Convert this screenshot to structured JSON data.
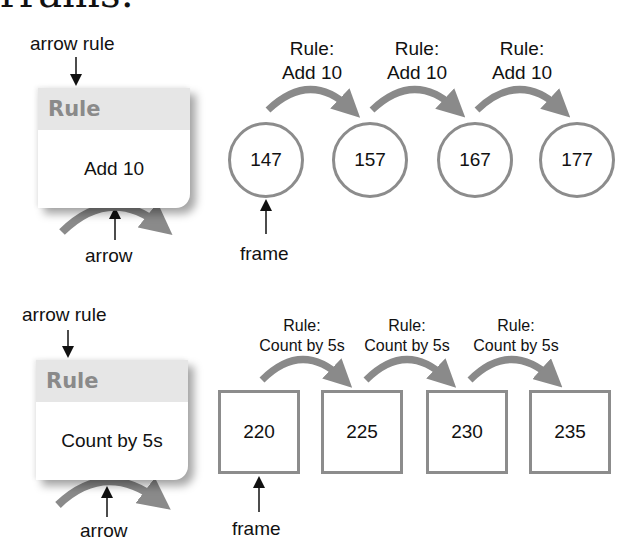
{
  "heading_fragment": "rrams:",
  "diagram_1": {
    "legend": {
      "arrow_rule_label": "arrow rule",
      "card_header": "Rule",
      "card_body": "Add 10",
      "arrow_label": "arrow"
    },
    "frame_label": "frame",
    "frame_shape": "circle",
    "steps": [
      {
        "rule_prefix": "Rule:",
        "rule_text": "Add 10"
      },
      {
        "rule_prefix": "Rule:",
        "rule_text": "Add 10"
      },
      {
        "rule_prefix": "Rule:",
        "rule_text": "Add 10"
      }
    ],
    "frames": [
      "147",
      "157",
      "167",
      "177"
    ]
  },
  "diagram_2": {
    "legend": {
      "arrow_rule_label": "arrow rule",
      "card_header": "Rule",
      "card_body": "Count by 5s",
      "arrow_label": "arrow"
    },
    "frame_label": "frame",
    "frame_shape": "square",
    "steps": [
      {
        "rule_prefix": "Rule:",
        "rule_text": "Count by 5s"
      },
      {
        "rule_prefix": "Rule:",
        "rule_text": "Count by 5s"
      },
      {
        "rule_prefix": "Rule:",
        "rule_text": "Count by 5s"
      }
    ],
    "frames": [
      "220",
      "225",
      "230",
      "235"
    ]
  },
  "colors": {
    "arrow": "#8a8a8a",
    "frame_border": "#8c8c8c",
    "card_header_bg": "#e6e6e6",
    "card_header_text": "#8a8a8a"
  }
}
